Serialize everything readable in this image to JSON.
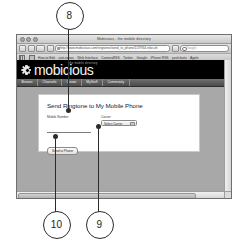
{
  "figure": {
    "callouts": [
      {
        "number": "8"
      },
      {
        "number": "9"
      },
      {
        "number": "10"
      }
    ]
  },
  "browser": {
    "window_title": "Mobicious - the mobile directory",
    "url": "http://www.mobicious.com/ringtones/send_to_phone/1/29764-nike-oh",
    "search_placeholder": "Google",
    "bookmarks": [
      {
        "label": "How-to Edit"
      },
      {
        "label": "anti-sonos"
      },
      {
        "label": "Web Interface"
      },
      {
        "label": "CameraRSS"
      },
      {
        "label": "Twitter"
      },
      {
        "label": "Google"
      },
      {
        "label": "iPhone RSS"
      },
      {
        "label": "yeah-bots"
      },
      {
        "label": "Apple"
      }
    ]
  },
  "site": {
    "logo_text": "mobicious",
    "logo_tagline": "the mobile directory",
    "nav": [
      {
        "label": "Browse"
      },
      {
        "label": "Channels"
      },
      {
        "label": "Create"
      },
      {
        "label": "MyStuff"
      },
      {
        "label": "Community"
      }
    ]
  },
  "form": {
    "title": "Send Ringtone to My Mobile Phone",
    "mobile_number_label": "Mobile Number",
    "mobile_number_value": "",
    "mobile_number_placeholder": "",
    "carrier_label": "Carrier",
    "carrier_value": "Select Carrier",
    "submit_label": "Send to Phone"
  }
}
